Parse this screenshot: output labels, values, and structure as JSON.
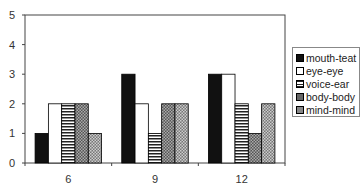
{
  "chart_data": {
    "type": "bar",
    "title": "",
    "xlabel": "",
    "ylabel": "",
    "categories": [
      "6",
      "9",
      "12"
    ],
    "ylim": [
      0,
      5
    ],
    "yticks": [
      "0",
      "1",
      "2",
      "3",
      "4",
      "5"
    ],
    "grid": false,
    "legend_position": "right",
    "series": [
      {
        "name": "mouth-teat",
        "values": [
          1,
          3,
          3
        ],
        "pattern": "solid-black"
      },
      {
        "name": "eye-eye",
        "values": [
          2,
          2,
          3
        ],
        "pattern": "white"
      },
      {
        "name": "voice-ear",
        "values": [
          2,
          1,
          2
        ],
        "pattern": "horizontal-stripes"
      },
      {
        "name": "body-body",
        "values": [
          2,
          2,
          1
        ],
        "pattern": "dense-crosshatch"
      },
      {
        "name": "mind-mind",
        "values": [
          1,
          2,
          2
        ],
        "pattern": "crosshatch"
      }
    ]
  },
  "legend": {
    "items": [
      "mouth-teat",
      "eye-eye",
      "voice-ear",
      "body-body",
      "mind-mind"
    ]
  }
}
